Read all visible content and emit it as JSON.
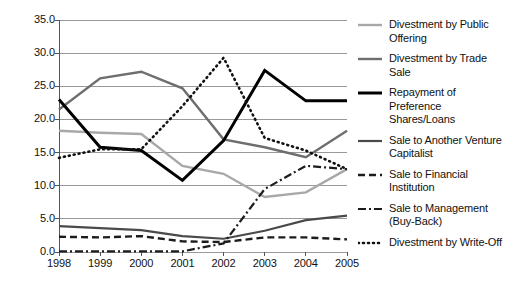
{
  "chart_data": {
    "type": "line",
    "title": "",
    "subtitle": "",
    "xlabel": "",
    "ylabel": "",
    "categories": [
      "1998",
      "1999",
      "2000",
      "2001",
      "2002",
      "2003",
      "2004",
      "2005"
    ],
    "ylim": [
      0.0,
      35.0
    ],
    "ytick_values": [
      0.0,
      5.0,
      10.0,
      15.0,
      20.0,
      25.0,
      30.0,
      35.0
    ],
    "ytick_labels": [
      "0.0",
      "5.0",
      "10.0",
      "15.0",
      "20.0",
      "25.0",
      "30.0",
      "35.0"
    ],
    "grid": true,
    "grid_axis": "y",
    "legend_position": "right",
    "series": [
      {
        "name": "Divestment by Public Offering",
        "label": "Divestment by Public\nOffering",
        "color": "#a8a8a8",
        "width": 2.4,
        "dash": "none",
        "values": [
          18.3,
          18.0,
          17.8,
          13.0,
          11.8,
          8.3,
          9.0,
          12.5
        ]
      },
      {
        "name": "Divestment by Trade Sale",
        "label": "Divestment by Trade Sale",
        "color": "#6e6e6e",
        "width": 2.4,
        "dash": "none",
        "values": [
          21.5,
          26.2,
          27.2,
          24.7,
          17.0,
          15.8,
          14.3,
          18.3
        ]
      },
      {
        "name": "Repayment of Preference Shares/Loans",
        "label": "Repayment of Preference\nShares/Loans",
        "color": "#000000",
        "width": 3.0,
        "dash": "none",
        "values": [
          23.0,
          15.8,
          15.3,
          10.8,
          16.8,
          27.4,
          22.8,
          22.8
        ]
      },
      {
        "name": "Sale to Another Venture Capitalist",
        "label": "Sale to Another Venture\nCapitalist",
        "color": "#4a4a4a",
        "width": 2.2,
        "dash": "none",
        "values": [
          3.9,
          3.6,
          3.3,
          2.4,
          2.0,
          3.2,
          4.8,
          5.5
        ]
      },
      {
        "name": "Sale to Financial Institution",
        "label": "Sale to Financial Institution",
        "color": "#1c1c1c",
        "width": 2.4,
        "dash": "7,4",
        "values": [
          2.3,
          2.2,
          2.4,
          1.6,
          1.5,
          2.2,
          2.2,
          1.9
        ]
      },
      {
        "name": "Sale to Management (Buy-Back)",
        "label": "Sale to Management\n(Buy-Back)",
        "color": "#1c1c1c",
        "width": 2.2,
        "dash": "8,3,2,3",
        "values": [
          0.1,
          0.1,
          0.1,
          0.1,
          1.3,
          9.5,
          13.0,
          12.5
        ]
      },
      {
        "name": "Divestment by Write-Off",
        "label": "Divestment by Write-Off",
        "color": "#111111",
        "width": 2.6,
        "dash": "1,4",
        "values": [
          14.2,
          15.5,
          15.5,
          22.0,
          29.3,
          17.2,
          15.3,
          12.5
        ]
      }
    ]
  }
}
